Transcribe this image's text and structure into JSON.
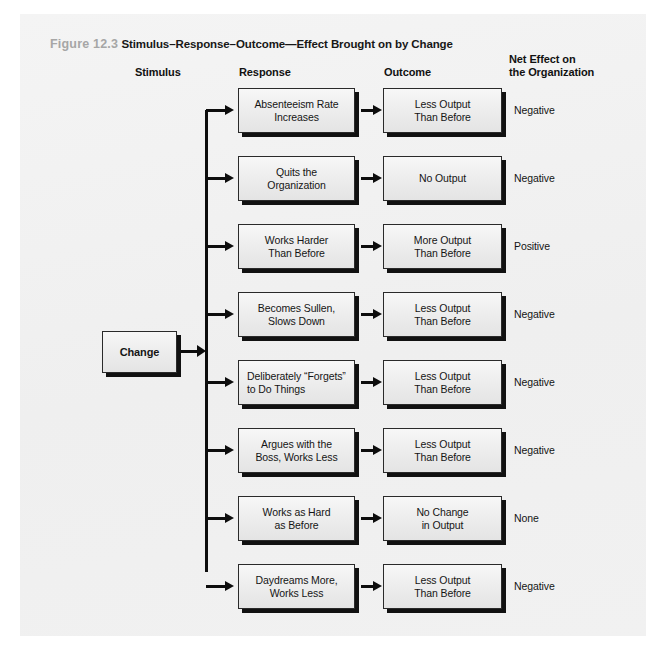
{
  "page": {
    "ghost_line": "",
    "background_color": "#ffffff",
    "panel_color": "#f2f2f2"
  },
  "figure": {
    "number": "Figure 12.3",
    "title": "Stimulus–Response–Outcome—Effect Brought on by Change"
  },
  "headers": {
    "stimulus": "Stimulus",
    "response": "Response",
    "outcome": "Outcome",
    "net_effect_line1": "Net Effect on",
    "net_effect_line2": "the Organization"
  },
  "stimulus": {
    "label": "Change"
  },
  "rows": [
    {
      "response_line1": "Absenteeism Rate",
      "response_line2": "Increases",
      "outcome_line1": "Less Output",
      "outcome_line2": "Than Before",
      "net_effect": "Negative",
      "response_align": "center"
    },
    {
      "response_line1": "Quits the",
      "response_line2": "Organization",
      "outcome_line1": "No Output",
      "outcome_line2": "",
      "net_effect": "Negative",
      "response_align": "center"
    },
    {
      "response_line1": "Works Harder",
      "response_line2": "Than Before",
      "outcome_line1": "More Output",
      "outcome_line2": "Than Before",
      "net_effect": "Positive",
      "response_align": "center"
    },
    {
      "response_line1": "Becomes Sullen,",
      "response_line2": "Slows Down",
      "outcome_line1": "Less Output",
      "outcome_line2": "Than Before",
      "net_effect": "Negative",
      "response_align": "center"
    },
    {
      "response_line1": "Deliberately “Forgets”",
      "response_line2": "to Do Things",
      "outcome_line1": "Less Output",
      "outcome_line2": "Than Before",
      "net_effect": "Negative",
      "response_align": "left"
    },
    {
      "response_line1": "Argues with the",
      "response_line2": "Boss, Works Less",
      "outcome_line1": "Less Output",
      "outcome_line2": "Than Before",
      "net_effect": "Negative",
      "response_align": "center"
    },
    {
      "response_line1": "Works as Hard",
      "response_line2": "as Before",
      "outcome_line1": "No Change",
      "outcome_line2": "in Output",
      "net_effect": "None",
      "response_align": "center"
    },
    {
      "response_line1": "Daydreams More,",
      "response_line2": "Works Less",
      "outcome_line1": "Less Output",
      "outcome_line2": "Than Before",
      "net_effect": "Negative",
      "response_align": "center"
    }
  ],
  "diagram_meta": {
    "row_count": 8,
    "first_row_top": 74,
    "row_spacing": 68,
    "box_shadow_color": "#111111",
    "box_border_color": "#2a2a2a",
    "connector_color": "#0d0d0d"
  }
}
